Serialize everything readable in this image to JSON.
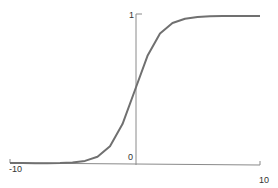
{
  "chart_data": {
    "type": "line",
    "title": "",
    "xlabel": "",
    "ylabel": "",
    "xlim": [
      -10,
      10
    ],
    "ylim": [
      0,
      1
    ],
    "grid": false,
    "legend": null,
    "x_tick_labels": [
      "-10",
      "10"
    ],
    "y_tick_labels": [
      "0",
      "1"
    ],
    "series": [
      {
        "name": "sigmoid",
        "function": "1/(1+exp(-x))",
        "x": [
          -10,
          -9,
          -8,
          -7,
          -6,
          -5,
          -4,
          -3,
          -2,
          -1,
          0,
          1,
          2,
          3,
          4,
          5,
          6,
          7,
          8,
          9,
          10
        ],
        "values": [
          0.0,
          0.0001,
          0.0003,
          0.0009,
          0.0025,
          0.0067,
          0.018,
          0.047,
          0.119,
          0.269,
          0.5,
          0.731,
          0.881,
          0.953,
          0.982,
          0.993,
          0.998,
          0.999,
          1.0,
          1.0,
          1.0
        ]
      }
    ],
    "colors": {
      "curve": "#707070",
      "axis": "#8a8a8a",
      "label": "#333333"
    }
  },
  "labels": {
    "xmin": "-10",
    "xmax": "10",
    "ymin": "0",
    "ymax": "1"
  }
}
